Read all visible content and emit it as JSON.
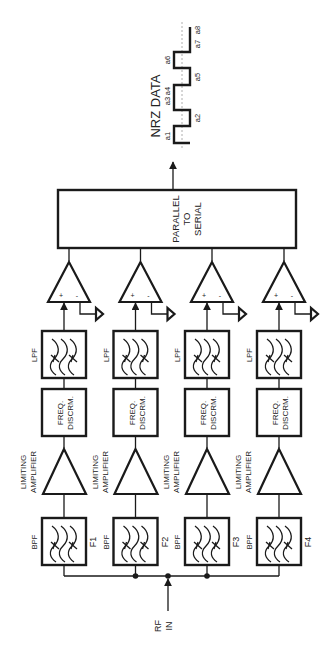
{
  "input": {
    "label_line1": "RF",
    "label_line2": "IN"
  },
  "output": {
    "label": "NRZ DATA",
    "bits": [
      "a1",
      "a2",
      "a3",
      "a4",
      "a5",
      "a6",
      "a7",
      "a8"
    ]
  },
  "serializer": {
    "line1": "PARALLEL",
    "line2": "TO",
    "line3": "SERIAL"
  },
  "channels": [
    {
      "bpf_label": "BPF",
      "freq_label": "F1",
      "amp_line1": "LIMITING",
      "amp_line2": "AMPLIFIER",
      "disc_line1": "FREQ.",
      "disc_line2": "DISCRM.",
      "lpf_label": "LPF",
      "comp_plus": "+",
      "comp_minus": "-"
    },
    {
      "bpf_label": "BPF",
      "freq_label": "F2",
      "amp_line1": "LIMITING",
      "amp_line2": "AMPLIFIER",
      "disc_line1": "FREQ.",
      "disc_line2": "DISCRM.",
      "lpf_label": "LPF",
      "comp_plus": "+",
      "comp_minus": "-"
    },
    {
      "bpf_label": "BPF",
      "freq_label": "F3",
      "amp_line1": "LIMITING",
      "amp_line2": "AMPLIFIER",
      "disc_line1": "FREQ.",
      "disc_line2": "DISCRM.",
      "lpf_label": "LPF",
      "comp_plus": "+",
      "comp_minus": "-"
    },
    {
      "bpf_label": "BPF",
      "freq_label": "F4",
      "amp_line1": "LIMITING",
      "amp_line2": "AMPLIFIER",
      "disc_line1": "FREQ.",
      "disc_line2": "DISCRM.",
      "lpf_label": "LPF",
      "comp_plus": "+",
      "comp_minus": "-"
    }
  ]
}
